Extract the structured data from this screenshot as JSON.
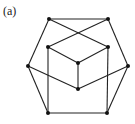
{
  "figure": {
    "label": "(a)",
    "nodes": [
      {
        "id": "TL",
        "x": 49,
        "y": 19
      },
      {
        "id": "TR",
        "x": 108,
        "y": 19
      },
      {
        "id": "ITL",
        "x": 48,
        "y": 47
      },
      {
        "id": "ITR",
        "x": 108,
        "y": 47
      },
      {
        "id": "C",
        "x": 78,
        "y": 63
      },
      {
        "id": "L",
        "x": 28,
        "y": 66
      },
      {
        "id": "R",
        "x": 128,
        "y": 66
      },
      {
        "id": "CB",
        "x": 78,
        "y": 89
      },
      {
        "id": "BL",
        "x": 48,
        "y": 113
      },
      {
        "id": "BR",
        "x": 107,
        "y": 113
      }
    ],
    "edges": [
      [
        "TL",
        "TR"
      ],
      [
        "TL",
        "L"
      ],
      [
        "L",
        "BL"
      ],
      [
        "BL",
        "BR"
      ],
      [
        "BR",
        "R"
      ],
      [
        "R",
        "TR"
      ],
      [
        "TL",
        "ITR"
      ],
      [
        "TR",
        "ITL"
      ],
      [
        "ITL",
        "C"
      ],
      [
        "ITR",
        "C"
      ],
      [
        "C",
        "CB"
      ],
      [
        "L",
        "CB"
      ],
      [
        "R",
        "CB"
      ],
      [
        "ITL",
        "BL"
      ],
      [
        "ITR",
        "BR"
      ]
    ]
  }
}
